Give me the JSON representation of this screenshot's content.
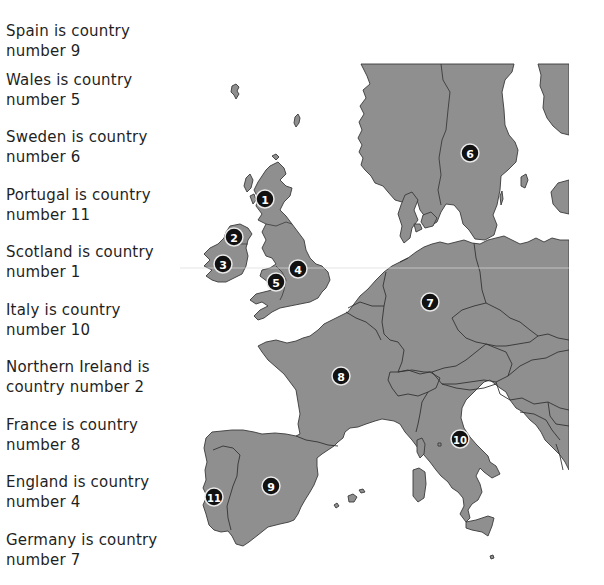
{
  "clues": [
    {
      "line1": "Spain is country",
      "line2": "number 9",
      "country": "Spain",
      "number": 9
    },
    {
      "line1": "Wales is country",
      "line2": "number 5",
      "country": "Wales",
      "number": 5
    },
    {
      "line1": "Sweden is country",
      "line2": "number 6",
      "country": "Sweden",
      "number": 6
    },
    {
      "line1": "Portugal is country",
      "line2": "number 11",
      "country": "Portugal",
      "number": 11
    },
    {
      "line1": "Scotland is country",
      "line2": "number 1",
      "country": "Scotland",
      "number": 1
    },
    {
      "line1": "Italy is country",
      "line2": "number 10",
      "country": "Italy",
      "number": 10
    },
    {
      "line1": "Northern Ireland is",
      "line2": "country number 2",
      "country": "Northern Ireland",
      "number": 2
    },
    {
      "line1": "France is country",
      "line2": "number 8",
      "country": "France",
      "number": 8
    },
    {
      "line1": "England is country",
      "line2": "number 4",
      "country": "England",
      "number": 4
    },
    {
      "line1": "Germany is country",
      "line2": "number 7",
      "country": "Germany",
      "number": 7
    }
  ],
  "map": {
    "land_color": "#8f8f8f",
    "border_color": "#3a3a3a",
    "marker_fill": "#111111",
    "marker_ring": "#e8e8e8",
    "markers": [
      {
        "label": "1",
        "region": "Scotland"
      },
      {
        "label": "2",
        "region": "Northern Ireland"
      },
      {
        "label": "3",
        "region": "Ireland"
      },
      {
        "label": "4",
        "region": "England"
      },
      {
        "label": "5",
        "region": "Wales"
      },
      {
        "label": "6",
        "region": "Sweden"
      },
      {
        "label": "7",
        "region": "Germany"
      },
      {
        "label": "8",
        "region": "France"
      },
      {
        "label": "9",
        "region": "Spain"
      },
      {
        "label": "10",
        "region": "Italy"
      },
      {
        "label": "11",
        "region": "Portugal"
      }
    ]
  }
}
